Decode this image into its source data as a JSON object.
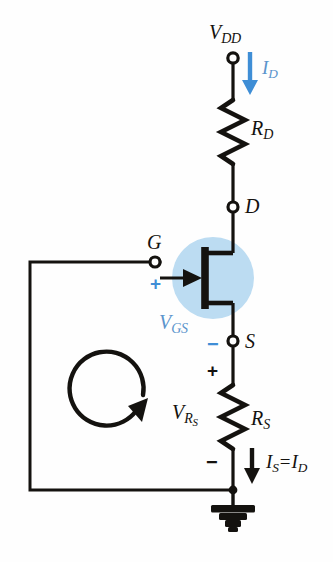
{
  "figure": {
    "colors": {
      "wire": "#14120f",
      "highlight_circle": "#bcdcf2",
      "accent_blue": "#3f8ed6",
      "label_blue": "#5b94cc",
      "background": "#fefefe"
    }
  },
  "labels": {
    "supply": {
      "text": "V",
      "sub": "DD"
    },
    "drain_current": {
      "text": "I",
      "sub": "D"
    },
    "resistor_drain": {
      "text": "R",
      "sub": "D"
    },
    "node_drain": {
      "text": "D"
    },
    "node_gate": {
      "text": "G"
    },
    "node_source": {
      "text": "S"
    },
    "gate_source_voltage": {
      "text": "V",
      "sub": "GS"
    },
    "source_resistor_voltage": {
      "text": "V",
      "sub": "R",
      "subsub": "S"
    },
    "resistor_source": {
      "text": "R",
      "sub": "S"
    },
    "source_current_equation": {
      "left": "I",
      "left_sub": "S",
      "operator": "=",
      "right": "I",
      "right_sub": "D"
    }
  },
  "polarity_signs": {
    "gate_plus": "+",
    "source_minus": "−",
    "rs_plus": "+",
    "rs_minus": "−"
  },
  "icons": {
    "ground": "ground-symbol",
    "loop_arrow": "kvl-loop-arrow-clockwise",
    "drain_current_arrow": "current-arrow-down",
    "source_current_arrow": "current-arrow-down",
    "jfet": "n-channel-jfet-symbol"
  }
}
